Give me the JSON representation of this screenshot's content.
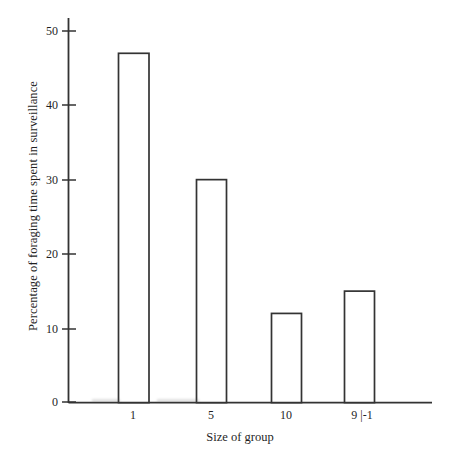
{
  "chart_data": {
    "type": "bar",
    "title": "",
    "subtitle": "",
    "xlabel": "Size of group",
    "ylabel": "Percentage of foraging time spent in surveillance",
    "categories": [
      "1",
      "5",
      "10",
      "9 |-1"
    ],
    "values": [
      47,
      30,
      12,
      15
    ],
    "series": [
      {
        "name": "Percentage of foraging time spent in surveillance",
        "values": [
          47,
          30,
          12,
          15
        ]
      }
    ],
    "ylim": [
      0,
      53
    ],
    "xlim": [
      0,
      100
    ],
    "yticks": [
      0,
      10,
      20,
      30,
      40,
      50
    ],
    "ytick_labels": [
      "0",
      "10",
      "20",
      "30",
      "40",
      "50"
    ],
    "xtick_labels": [
      "1",
      "5",
      "10",
      "9 |-1"
    ],
    "grid": false,
    "legend": false,
    "legend_position": "none",
    "bar_fill": "#ffffff",
    "bar_edge_color": "#333333",
    "axis_color": "#333333",
    "background": "#ffffff"
  },
  "axes": {
    "y_ticks": [
      {
        "label": "50",
        "value": 50
      },
      {
        "label": "40",
        "value": 40
      },
      {
        "label": "30",
        "value": 30
      },
      {
        "label": "20",
        "value": 20
      },
      {
        "label": "10",
        "value": 10
      },
      {
        "label": "0",
        "value": 0
      }
    ],
    "x_ticks": [
      {
        "label": "1",
        "value": 47
      },
      {
        "label": "5",
        "value": 30
      },
      {
        "label": "10",
        "value": 12
      },
      {
        "label": "9 |-1",
        "value": 15
      }
    ]
  },
  "labels": {
    "y_axis_title": "Percentage of foraging time spent in surveillance",
    "x_axis_title": "Size of group"
  }
}
